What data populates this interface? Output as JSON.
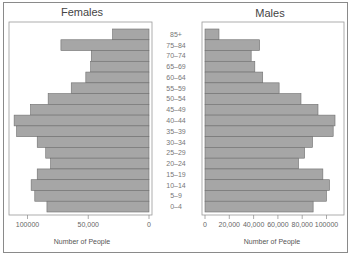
{
  "chart_data": {
    "type": "bar",
    "orientation": "horizontal",
    "layout": "population-pyramid",
    "categories": [
      "85+",
      "75–84",
      "70–74",
      "65–69",
      "60–64",
      "55–59",
      "50–54",
      "45–49",
      "40–44",
      "35–39",
      "30–34",
      "25–29",
      "20–24",
      "15–19",
      "10–14",
      "5–9",
      "0–4"
    ],
    "series": [
      {
        "name": "Females",
        "values": [
          30000,
          72500,
          47500,
          48000,
          52000,
          64000,
          83000,
          97500,
          111000,
          109000,
          92000,
          85000,
          81000,
          92000,
          97000,
          94000,
          84000
        ]
      },
      {
        "name": "Males",
        "values": [
          11500,
          45000,
          38000,
          41000,
          47500,
          61000,
          79000,
          93000,
          107000,
          105500,
          88500,
          82000,
          77000,
          97000,
          102500,
          100000,
          89000
        ]
      }
    ],
    "panels": [
      {
        "title": "Females",
        "xlabel": "Number of People",
        "xlim": [
          0,
          115000
        ],
        "direction": "reversed",
        "ticks": [
          100000,
          50000,
          0
        ],
        "tick_labels": [
          "100000",
          "50,000",
          "0"
        ]
      },
      {
        "title": "Males",
        "xlabel": "Number of People",
        "xlim": [
          0,
          115000
        ],
        "direction": "normal",
        "ticks": [
          0,
          20000,
          40000,
          60000,
          80000,
          100000
        ],
        "tick_labels": [
          "0",
          "20,000",
          "40,000",
          "60,000",
          "80,000",
          "100000"
        ]
      }
    ],
    "grid": false,
    "legend": "none"
  }
}
